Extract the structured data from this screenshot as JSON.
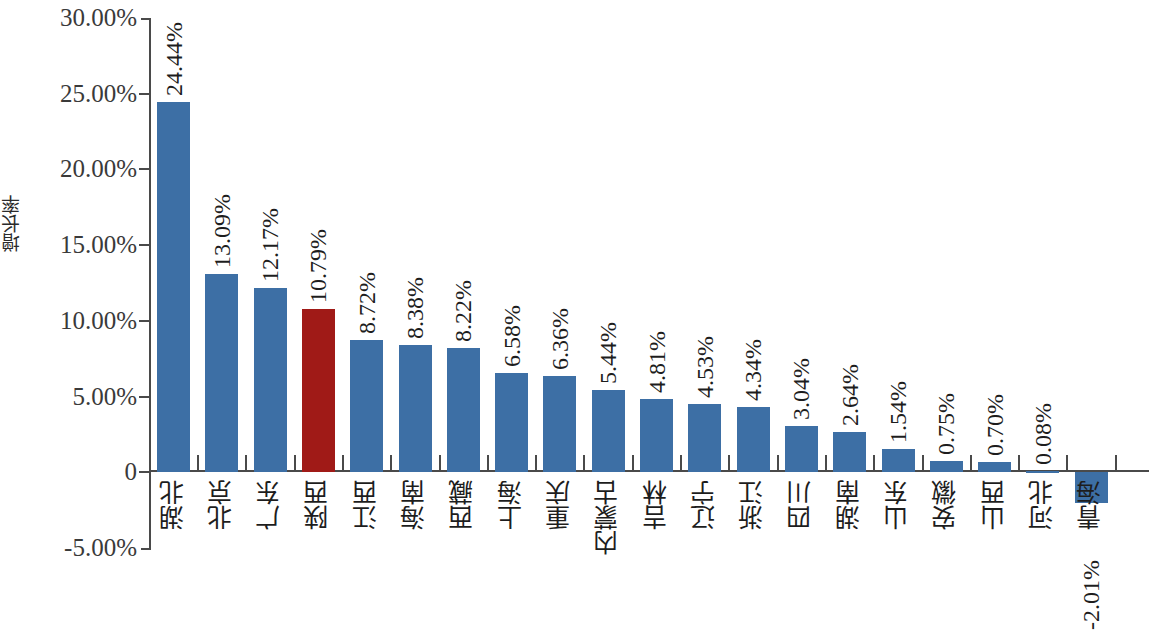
{
  "chart_data": {
    "type": "bar",
    "title": "",
    "subtitle": "",
    "xlabel": "",
    "ylabel": "增长率",
    "ylim": [
      -5,
      30
    ],
    "ytick_labels": [
      "30.00%",
      "25.00%",
      "20.00%",
      "15.00%",
      "10.00%",
      "5.00%",
      "0",
      "-5.00%"
    ],
    "ytick_values": [
      30,
      25,
      20,
      15,
      10,
      5,
      0,
      -5
    ],
    "grid": false,
    "legend": null,
    "value_label_suffix": "%",
    "categories": [
      "湖北",
      "北京",
      "广东",
      "陕西",
      "江西",
      "海南",
      "西藏",
      "上海",
      "重庆",
      "内蒙古",
      "吉林",
      "辽宁",
      "浙江",
      "四川",
      "湖南",
      "山东",
      "安徽",
      "山西",
      "河北",
      "青海"
    ],
    "values": [
      24.44,
      13.09,
      12.17,
      10.79,
      8.72,
      8.38,
      8.22,
      6.58,
      6.36,
      5.44,
      4.81,
      4.53,
      4.34,
      3.04,
      2.64,
      1.54,
      0.75,
      0.7,
      0.08,
      -2.01
    ],
    "value_labels": [
      "24.44%",
      "13.09%",
      "12.17%",
      "10.79%",
      "8.72%",
      "8.38%",
      "8.22%",
      "6.58%",
      "6.36%",
      "5.44%",
      "4.81%",
      "4.53%",
      "4.34%",
      "3.04%",
      "2.64%",
      "1.54%",
      "0.75%",
      "0.70%",
      "0.08%",
      "-2.01%"
    ],
    "highlight_index": 3,
    "colors": {
      "bar": "#3d6fa5",
      "highlight_bar": "#a01a17",
      "axis": "#4a4a4a",
      "text": "#1d1d1d",
      "background": "#ffffff"
    }
  }
}
